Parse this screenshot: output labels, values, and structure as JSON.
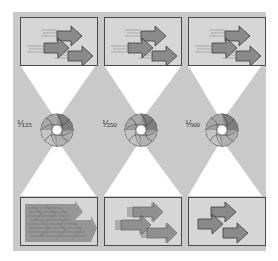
{
  "colors": {
    "panel": "#c9c9c9",
    "box_fill": "#d6d6d6",
    "box_border": "#4a4a4a",
    "arrow_fill": "#8a8a8a",
    "arrow_stroke": "#3a3a3a",
    "funnel": "#ffffff"
  },
  "columns": [
    {
      "id": "col-125",
      "shutter_speed": "1/125",
      "label": "¹⁄₁₂₅",
      "blur_level": "high"
    },
    {
      "id": "col-250",
      "shutter_speed": "1/250",
      "label": "¹⁄₂₅₀",
      "blur_level": "medium"
    },
    {
      "id": "col-500",
      "shutter_speed": "1/500",
      "label": "¹⁄₅₀₀",
      "blur_level": "none"
    }
  ],
  "icons": {
    "top_subject": "moving-arrows-icon",
    "aperture": "camera-aperture-icon",
    "bottom_result": "captured-arrows-icon"
  }
}
